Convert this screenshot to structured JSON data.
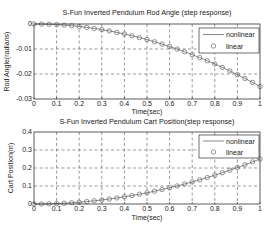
{
  "chart_data": [
    {
      "type": "line",
      "title": "S-Fun Inverted Pendulum Rod Angle (step response)",
      "xlabel": "Time(sec)",
      "ylabel": "Rod Angle(radians)",
      "xlim": [
        0,
        1
      ],
      "ylim": [
        -0.03,
        0
      ],
      "xticks": [
        0,
        0.1,
        0.2,
        0.3,
        0.4,
        0.5,
        0.6,
        0.7,
        0.8,
        0.9,
        1
      ],
      "xtick_labels": [
        "0",
        "0.1",
        "0.2",
        "0.3",
        "0.4",
        "0.5",
        "0.6",
        "0.7",
        "0.8",
        "0.9",
        "1"
      ],
      "yticks": [
        0,
        -0.01,
        -0.02,
        -0.03
      ],
      "ytick_labels": [
        "0",
        "-0.01",
        "-0.02",
        "-0.03"
      ],
      "grid": true,
      "legend_position": "top-right",
      "x": [
        0,
        0.0333,
        0.0667,
        0.1,
        0.1333,
        0.1667,
        0.2,
        0.2333,
        0.2667,
        0.3,
        0.3333,
        0.3667,
        0.4,
        0.4333,
        0.4667,
        0.5,
        0.5333,
        0.5667,
        0.6,
        0.6333,
        0.6667,
        0.7,
        0.7333,
        0.7667,
        0.8,
        0.8333,
        0.8667,
        0.9,
        0.9333,
        0.9667,
        1
      ],
      "series": [
        {
          "name": "nonlinear",
          "style": "line",
          "values": [
            0,
            -3e-05,
            -0.00011,
            -0.00025,
            -0.00044,
            -0.00069,
            -0.001,
            -0.00136,
            -0.00178,
            -0.00225,
            -0.00278,
            -0.00336,
            -0.004,
            -0.00469,
            -0.00544,
            -0.00625,
            -0.00711,
            -0.00803,
            -0.009,
            -0.01003,
            -0.01111,
            -0.01225,
            -0.01344,
            -0.01469,
            -0.016,
            -0.01736,
            -0.01878,
            -0.02025,
            -0.02178,
            -0.02336,
            -0.025
          ]
        },
        {
          "name": "linear",
          "style": "circle-marker",
          "values": [
            0,
            -3e-05,
            -0.00011,
            -0.00025,
            -0.00044,
            -0.00069,
            -0.001,
            -0.00136,
            -0.00178,
            -0.00225,
            -0.00278,
            -0.00336,
            -0.004,
            -0.00469,
            -0.00544,
            -0.00625,
            -0.00711,
            -0.00803,
            -0.009,
            -0.01003,
            -0.01111,
            -0.01225,
            -0.01344,
            -0.01469,
            -0.016,
            -0.01736,
            -0.01878,
            -0.02025,
            -0.02178,
            -0.02336,
            -0.025
          ]
        }
      ]
    },
    {
      "type": "line",
      "title": "S-Fun Inverted Pendulum Cart Position(step response)",
      "xlabel": "Time(sec)",
      "ylabel": "Cart Position(m)",
      "xlim": [
        0,
        1
      ],
      "ylim": [
        0,
        0.4
      ],
      "xticks": [
        0,
        0.1,
        0.2,
        0.3,
        0.4,
        0.5,
        0.6,
        0.7,
        0.8,
        0.9,
        1
      ],
      "xtick_labels": [
        "0",
        "0.1",
        "0.2",
        "0.3",
        "0.4",
        "0.5",
        "0.6",
        "0.7",
        "0.8",
        "0.9",
        "1"
      ],
      "yticks": [
        0,
        0.1,
        0.2,
        0.3,
        0.4
      ],
      "ytick_labels": [
        "0",
        "0.1",
        "0.2",
        "0.3",
        "0.4"
      ],
      "grid": true,
      "legend_position": "top-right",
      "x": [
        0,
        0.0333,
        0.0667,
        0.1,
        0.1333,
        0.1667,
        0.2,
        0.2333,
        0.2667,
        0.3,
        0.3333,
        0.3667,
        0.4,
        0.4333,
        0.4667,
        0.5,
        0.5333,
        0.5667,
        0.6,
        0.6333,
        0.6667,
        0.7,
        0.7333,
        0.7667,
        0.8,
        0.8333,
        0.8667,
        0.9,
        0.9333,
        0.9667,
        1
      ],
      "series": [
        {
          "name": "nonlinear",
          "style": "line",
          "values": [
            0,
            0.0003,
            0.0011,
            0.0025,
            0.0044,
            0.0069,
            0.01,
            0.0136,
            0.0178,
            0.0225,
            0.0278,
            0.0336,
            0.04,
            0.0469,
            0.0544,
            0.0625,
            0.0711,
            0.0803,
            0.09,
            0.1003,
            0.1111,
            0.1225,
            0.1344,
            0.1469,
            0.16,
            0.1736,
            0.1878,
            0.2025,
            0.2178,
            0.2336,
            0.25
          ]
        },
        {
          "name": "linear",
          "style": "circle-marker",
          "values": [
            0,
            0.0003,
            0.0011,
            0.0025,
            0.0044,
            0.0069,
            0.01,
            0.0136,
            0.0178,
            0.0225,
            0.0278,
            0.0336,
            0.04,
            0.0469,
            0.0544,
            0.0625,
            0.0711,
            0.0803,
            0.09,
            0.1003,
            0.1111,
            0.1225,
            0.1344,
            0.1469,
            0.16,
            0.1736,
            0.1878,
            0.2025,
            0.2178,
            0.2336,
            0.25
          ]
        }
      ]
    }
  ]
}
